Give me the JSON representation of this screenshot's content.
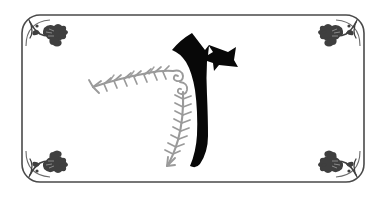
{
  "artwork": {
    "kind": "decorative-illuminated-letter-plate",
    "title": "Ornamental initial letter plate",
    "canvas": {
      "width": 381,
      "height": 197,
      "background": "#ffffff"
    },
    "colors": {
      "background": "#ffffff",
      "frame": "#4a4a4a",
      "corner_ornament": "#3f3f3f",
      "vine": "#9a9a9a",
      "vine_light": "#b0b0b0",
      "letter": "#080808"
    },
    "frame": {
      "name": "rounded-rectangle-border",
      "x": 22,
      "y": 15,
      "width": 342,
      "height": 167,
      "corner_radius": 18,
      "stroke_width": 1.6,
      "stroke": "#4a4a4a"
    },
    "corner_ornaments": [
      {
        "position": "top-left",
        "glyph": "oak-leaf-cluster",
        "x": 46,
        "y": 32,
        "flip_x": false,
        "flip_y": false
      },
      {
        "position": "top-right",
        "glyph": "oak-leaf-cluster",
        "x": 340,
        "y": 32,
        "flip_x": true,
        "flip_y": false
      },
      {
        "position": "bottom-left",
        "glyph": "oak-leaf-cluster",
        "x": 46,
        "y": 165,
        "flip_x": false,
        "flip_y": true
      },
      {
        "position": "bottom-right",
        "glyph": "oak-leaf-cluster",
        "x": 340,
        "y": 165,
        "flip_x": true,
        "flip_y": true
      }
    ],
    "letter": {
      "name": "hebrew-style-initial",
      "description": "Angular crowned head with horizontal arm, curved tapering descending stem",
      "fill": "#080808",
      "bounds": {
        "x": 172,
        "y": 33,
        "width": 66,
        "height": 132
      }
    },
    "vines": [
      {
        "name": "horizontal-leafy-vine",
        "orientation": "horizontal",
        "color": "#9a9a9a",
        "start": {
          "x": 92,
          "y": 86
        },
        "end": {
          "x": 176,
          "y": 72
        },
        "leaf_pairs": 8,
        "tip": "arrow-leaf",
        "terminal": "spiral-curl"
      },
      {
        "name": "vertical-leafy-vine",
        "orientation": "vertical",
        "color": "#9a9a9a",
        "start": {
          "x": 182,
          "y": 88
        },
        "end": {
          "x": 166,
          "y": 168
        },
        "leaf_pairs": 9,
        "tip": "arrow-leaf",
        "terminal": "spiral-curl"
      }
    ],
    "spirals": [
      {
        "name": "junction-spiral-upper",
        "x": 176,
        "y": 74,
        "radius": 7
      },
      {
        "name": "junction-spiral-lower",
        "x": 183,
        "y": 86,
        "radius": 6
      }
    ]
  }
}
